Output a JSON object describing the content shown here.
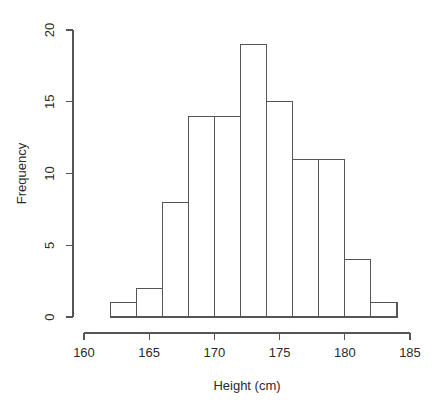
{
  "chart_data": {
    "type": "bar",
    "title": "",
    "subtitle": "",
    "xlabel": "Height (cm)",
    "ylabel": "Frequency",
    "xlim": [
      160,
      185
    ],
    "ylim": [
      0,
      20
    ],
    "grid": false,
    "legend": null,
    "bin_width": 2,
    "bin_edges": [
      162,
      164,
      166,
      168,
      170,
      172,
      174,
      176,
      178,
      180,
      182,
      184
    ],
    "categories": [
      "162-164",
      "164-166",
      "166-168",
      "168-170",
      "170-172",
      "172-174",
      "174-176",
      "176-178",
      "178-180",
      "180-182",
      "182-184"
    ],
    "values": [
      1,
      2,
      8,
      14,
      14,
      19,
      15,
      11,
      11,
      4,
      1
    ],
    "x_tick_labels": [
      "160",
      "165",
      "170",
      "175",
      "180",
      "185"
    ],
    "x_tick_values": [
      160,
      165,
      170,
      175,
      180,
      185
    ],
    "y_tick_labels": [
      "0",
      "5",
      "10",
      "15",
      "20"
    ],
    "y_tick_values": [
      0,
      5,
      10,
      15,
      20
    ],
    "bar_fill_color": "#ffffff",
    "bar_stroke_color": "#555555",
    "axis_color": "#555555",
    "background_color": "#ffffff"
  }
}
